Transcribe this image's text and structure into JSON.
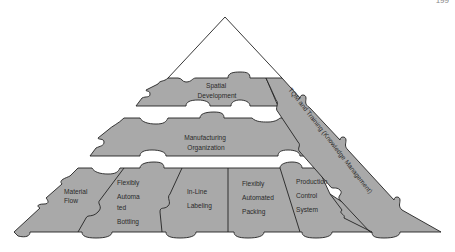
{
  "page_number": "199",
  "diagram": {
    "type": "puzzle-pyramid",
    "apex_label": "",
    "layers": [
      {
        "id": "top",
        "labels": [
          "Spatial",
          "Development"
        ]
      },
      {
        "id": "middle",
        "labels": [
          "Manufacturing",
          "Organization"
        ]
      },
      {
        "id": "base",
        "blocks": [
          {
            "id": "material-flow",
            "labels": [
              "Material",
              "Flow"
            ]
          },
          {
            "id": "flexibly-automated-bottling",
            "labels": [
              "Flexibly",
              "Automa",
              "ted",
              "Bottling"
            ]
          },
          {
            "id": "inline-labeling",
            "labels": [
              "In-Line",
              "Labeling"
            ]
          },
          {
            "id": "flexibly-automated-packing",
            "labels": [
              "Flexibly",
              "Automated",
              "Packing"
            ]
          },
          {
            "id": "production-control-system",
            "labels": [
              "Production",
              "Control",
              "System"
            ]
          }
        ]
      }
    ],
    "side_pillar": {
      "label": "TQM and Training (Knowledge Management)"
    },
    "colors": {
      "piece_fill": "#a9a9a9",
      "stroke": "#222222",
      "background": "#ffffff"
    }
  }
}
